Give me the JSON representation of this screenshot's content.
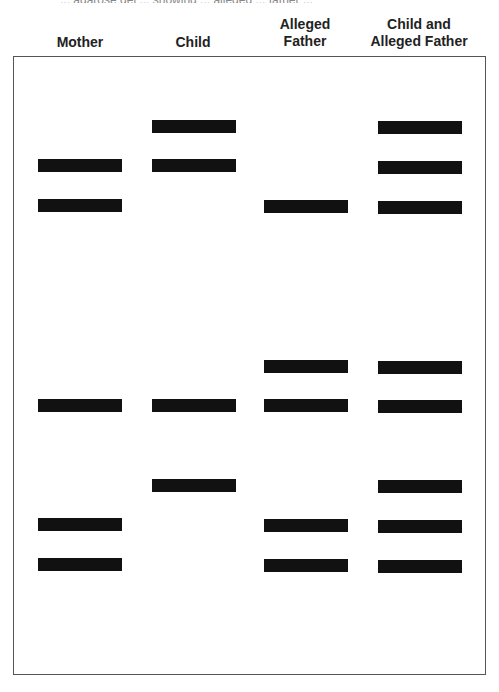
{
  "caption_fragment": "... agarose gel ... showing ... alleged ... father ...",
  "lanes": [
    {
      "label": "Mother",
      "center_x": 80
    },
    {
      "label": "Child",
      "center_x": 193
    },
    {
      "label": "Alleged Father",
      "center_x": 305
    },
    {
      "label": "Child and Alleged Father",
      "center_x": 419
    }
  ],
  "bands": {
    "mother": [
      164,
      204,
      404,
      523,
      563
    ],
    "child": [
      125,
      164,
      404,
      484
    ],
    "alleged_father": [
      205,
      365,
      404,
      524,
      564
    ],
    "child_and_alleged_father": [
      126,
      166,
      206,
      366,
      405,
      485,
      525,
      565
    ]
  },
  "colors": {
    "band": "#111111",
    "border": "#555555",
    "text": "#222222"
  }
}
